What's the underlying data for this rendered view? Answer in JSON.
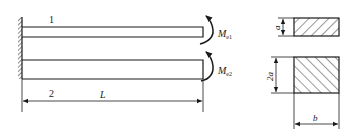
{
  "figure": {
    "type": "cantilever-beams-with-end-moments",
    "colors": {
      "stroke": "#1a1a1a",
      "background": "#ffffff"
    },
    "beams": [
      {
        "id": "beam-1",
        "label": "1",
        "moment": {
          "symbol": "M",
          "subscript": "e1"
        }
      },
      {
        "id": "beam-2",
        "label": "2",
        "moment": {
          "symbol": "M",
          "subscript": "e2"
        }
      }
    ],
    "length_dimension": {
      "label": "L"
    },
    "cross_sections": [
      {
        "id": "section-1",
        "height_label": "a",
        "hatch": "forward-diagonal"
      },
      {
        "id": "section-2",
        "height_label": "2a",
        "width_label": "b",
        "hatch": "backward-diagonal"
      }
    ]
  }
}
